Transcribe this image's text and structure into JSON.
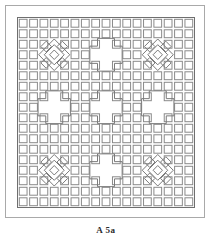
{
  "figure": {
    "caption": "A 5а",
    "plate_label": "A",
    "plate_number": "5а",
    "background_color": "#ffffff",
    "outer_frame_color": "#a9a9a9",
    "plate_border_color": "#6f6f6f",
    "cell_stroke_color": "#8a8a8a",
    "motif_stroke_color": "#7a7a7a"
  },
  "pattern": {
    "type": "lattice-grid-ornament",
    "columns": 17,
    "rows": 18,
    "cell_unit_px": 10.2,
    "cell_inner_inset_px": 1.6,
    "description": "Grid of open square cells; negative-space crosses and diamond lozenges form the ornament.",
    "motifs": [
      {
        "name": "diamond-cluster-top-left",
        "shape": "diamond",
        "col": 3,
        "row": 3,
        "span": 3
      },
      {
        "name": "diamond-cluster-top-right",
        "shape": "diamond",
        "col": 13,
        "row": 3,
        "span": 3
      },
      {
        "name": "diamond-cluster-bottom-left",
        "shape": "diamond",
        "col": 3,
        "row": 14,
        "span": 3
      },
      {
        "name": "diamond-cluster-bottom-right",
        "shape": "diamond",
        "col": 13,
        "row": 14,
        "span": 3
      },
      {
        "name": "cross-top-center",
        "shape": "cross",
        "col": 8,
        "row": 3,
        "span": 3
      },
      {
        "name": "cross-center",
        "shape": "cross",
        "col": 8,
        "row": 8,
        "span": 3
      },
      {
        "name": "cross-bottom-center",
        "shape": "cross",
        "col": 8,
        "row": 14,
        "span": 3
      },
      {
        "name": "cross-middle-left",
        "shape": "cross",
        "col": 3,
        "row": 8,
        "span": 3
      },
      {
        "name": "cross-middle-right",
        "shape": "cross",
        "col": 13,
        "row": 8,
        "span": 3
      }
    ],
    "blank_cells": [
      [
        8,
        2
      ],
      [
        8,
        3
      ],
      [
        8,
        4
      ],
      [
        7,
        3
      ],
      [
        9,
        3
      ],
      [
        8,
        7
      ],
      [
        8,
        8
      ],
      [
        8,
        9
      ],
      [
        7,
        8
      ],
      [
        9,
        8
      ],
      [
        8,
        13
      ],
      [
        8,
        14
      ],
      [
        8,
        15
      ],
      [
        7,
        14
      ],
      [
        9,
        14
      ],
      [
        3,
        7
      ],
      [
        3,
        8
      ],
      [
        3,
        9
      ],
      [
        2,
        8
      ],
      [
        4,
        8
      ],
      [
        13,
        7
      ],
      [
        13,
        8
      ],
      [
        13,
        9
      ],
      [
        12,
        8
      ],
      [
        14,
        8
      ],
      [
        3,
        2
      ],
      [
        3,
        3
      ],
      [
        3,
        4
      ],
      [
        2,
        3
      ],
      [
        4,
        3
      ],
      [
        13,
        2
      ],
      [
        13,
        3
      ],
      [
        13,
        4
      ],
      [
        12,
        3
      ],
      [
        14,
        3
      ],
      [
        3,
        13
      ],
      [
        3,
        14
      ],
      [
        3,
        15
      ],
      [
        2,
        14
      ],
      [
        4,
        14
      ],
      [
        13,
        13
      ],
      [
        13,
        14
      ],
      [
        13,
        15
      ],
      [
        12,
        14
      ],
      [
        14,
        14
      ]
    ]
  }
}
